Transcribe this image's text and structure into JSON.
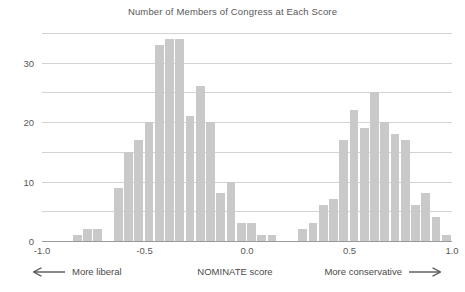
{
  "chart_data": {
    "type": "bar",
    "title": "Number of Members of Congress at Each Score",
    "xlabel": "NOMINATE score",
    "ylabel": "",
    "xlim": [
      -1.0,
      1.0
    ],
    "ylim": [
      0,
      36
    ],
    "grid": true,
    "grid_interval": 5,
    "legend": "none",
    "bin_width": 0.05,
    "bar_color": "#c9c9c9",
    "x_ticks": [
      -1.0,
      -0.5,
      0.0,
      0.5,
      1.0
    ],
    "x_tick_labels": [
      "-1.0",
      "-0.5",
      "0.0",
      "0.5",
      "1.0"
    ],
    "y_ticks": [
      0,
      10,
      20,
      30
    ],
    "y_tick_labels": [
      "0",
      "10",
      "20",
      "30"
    ],
    "gridline_values": [
      5,
      10,
      15,
      20,
      25,
      30,
      35
    ],
    "bin_left_edges": [
      -1.0,
      -0.95,
      -0.9,
      -0.85,
      -0.8,
      -0.75,
      -0.7,
      -0.65,
      -0.6,
      -0.55,
      -0.5,
      -0.45,
      -0.4,
      -0.35,
      -0.3,
      -0.25,
      -0.2,
      -0.15,
      -0.1,
      -0.05,
      0.0,
      0.05,
      0.1,
      0.15,
      0.2,
      0.25,
      0.3,
      0.35,
      0.4,
      0.45,
      0.5,
      0.55,
      0.6,
      0.65,
      0.7,
      0.75,
      0.8,
      0.85,
      0.9,
      0.95
    ],
    "values": [
      0,
      0,
      0,
      1,
      2,
      2,
      0,
      9,
      15,
      17,
      20,
      33,
      34,
      34,
      21,
      26,
      20,
      8,
      10,
      3,
      3,
      1,
      1,
      0,
      0,
      2,
      3,
      6,
      7,
      17,
      22,
      19,
      25,
      20,
      18,
      17,
      6,
      8,
      4,
      1
    ],
    "annotations": {
      "left_label": "More liberal",
      "left_arrow": "left-arrow-icon",
      "center_label": "NOMINATE score",
      "right_label": "More conservative",
      "right_arrow": "right-arrow-icon"
    }
  }
}
